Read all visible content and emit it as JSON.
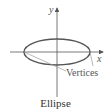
{
  "diagram": {
    "caption": "Ellipse",
    "axes": {
      "x_label": "x",
      "y_label": "y"
    },
    "annotation": "Vertices",
    "colors": {
      "axis": "#555555",
      "ellipse": "#555555",
      "leader": "#999999",
      "text": "#555555"
    },
    "ellipse": {
      "cx": 57,
      "cy": 52,
      "rx": 33,
      "ry": 13
    }
  }
}
